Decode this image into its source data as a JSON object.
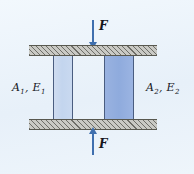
{
  "figure": {
    "background_color": "#eaf2fa"
  },
  "members": {
    "left": {
      "label_area": "A",
      "label_area_sub": "1",
      "label_modulus": "E",
      "label_modulus_sub": "1",
      "separator": ",",
      "fill_color": "#c3d5ee",
      "edge_color": "#4a5d80"
    },
    "right": {
      "label_area": "A",
      "label_area_sub": "2",
      "label_modulus": "E",
      "label_modulus_sub": "2",
      "separator": ",",
      "fill_color": "#8fabdd",
      "edge_color": "#4a5d80"
    }
  },
  "plates": {
    "top": {
      "name": "rigid-plate-top",
      "fill_color": "#c9c9c4",
      "hatch_color": "#6e6e68"
    },
    "bottom": {
      "name": "rigid-plate-bottom",
      "fill_color": "#c9c9c4",
      "hatch_color": "#6e6e68"
    }
  },
  "forces": {
    "top": {
      "label": "F",
      "direction": "down",
      "color": "#3f6fae"
    },
    "bottom": {
      "label": "F",
      "direction": "up",
      "color": "#3f6fae"
    }
  }
}
